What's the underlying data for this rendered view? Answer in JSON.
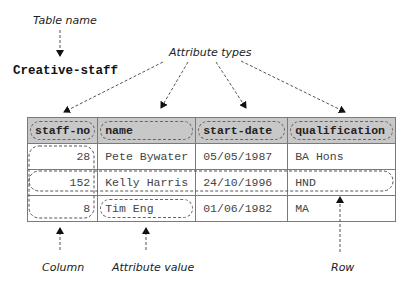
{
  "annotations": {
    "table_name_label": "Table name",
    "attribute_types_label": "Attribute types",
    "column_label": "Column",
    "attribute_value_label": "Attribute value",
    "row_label": "Row"
  },
  "relation": {
    "name": "Creative-staff",
    "columns": [
      "staff-no",
      "name",
      "start-date",
      "qualification"
    ],
    "rows": [
      [
        "28",
        "Pete Bywater",
        "05/05/1987",
        "BA Hons"
      ],
      [
        "152",
        "Kelly Harris",
        "24/10/1996",
        "HND"
      ],
      [
        "8",
        "Tim Eng",
        "01/06/1982",
        "MA"
      ]
    ]
  },
  "colors": {
    "header_fill": "#c8c8c8",
    "border": "#7a7a7a",
    "dashed_line": "#555555"
  }
}
